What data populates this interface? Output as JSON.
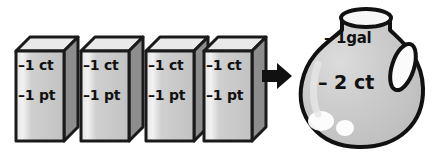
{
  "scene": {
    "title": "Unit conversion illustration: four one-quart cartons equal one gallon jug",
    "background_color": "#ffffff",
    "width": 442,
    "height": 155
  },
  "cartons": [
    {
      "id": "carton-1",
      "label_top": "–1 ct",
      "label_bottom": "–1 pt",
      "x": 12,
      "front_color": "#c9c9c9",
      "side_color": "#8f8f8f",
      "top_color": "#e8e8e8",
      "outline_color": "#1a1a1a"
    },
    {
      "id": "carton-2",
      "label_top": "–1 ct",
      "label_bottom": "–1 pt",
      "x": 77,
      "front_color": "#c9c9c9",
      "side_color": "#8f8f8f",
      "top_color": "#e8e8e8",
      "outline_color": "#1a1a1a"
    },
    {
      "id": "carton-3",
      "label_top": "–1 ct",
      "label_bottom": "–1 pt",
      "x": 142,
      "front_color": "#c9c9c9",
      "side_color": "#8f8f8f",
      "top_color": "#e8e8e8",
      "outline_color": "#1a1a1a"
    },
    {
      "id": "carton-4",
      "label_top": "–1 ct",
      "label_bottom": "–1 pt",
      "x": 200,
      "front_color": "#c9c9c9",
      "side_color": "#8f8f8f",
      "top_color": "#e8e8e8",
      "outline_color": "#1a1a1a"
    }
  ],
  "arrow": {
    "icon": "arrow-right-icon",
    "direction": "right",
    "color": "#111111"
  },
  "jug": {
    "label_top": "– 1gal",
    "label_bottom": "– 2 ct",
    "body_color": "#c9c9c9",
    "highlight_color": "#e0e0e0",
    "outline_color": "#111111",
    "handle_color": "#ffffff",
    "shine_color": "#ffffff"
  }
}
